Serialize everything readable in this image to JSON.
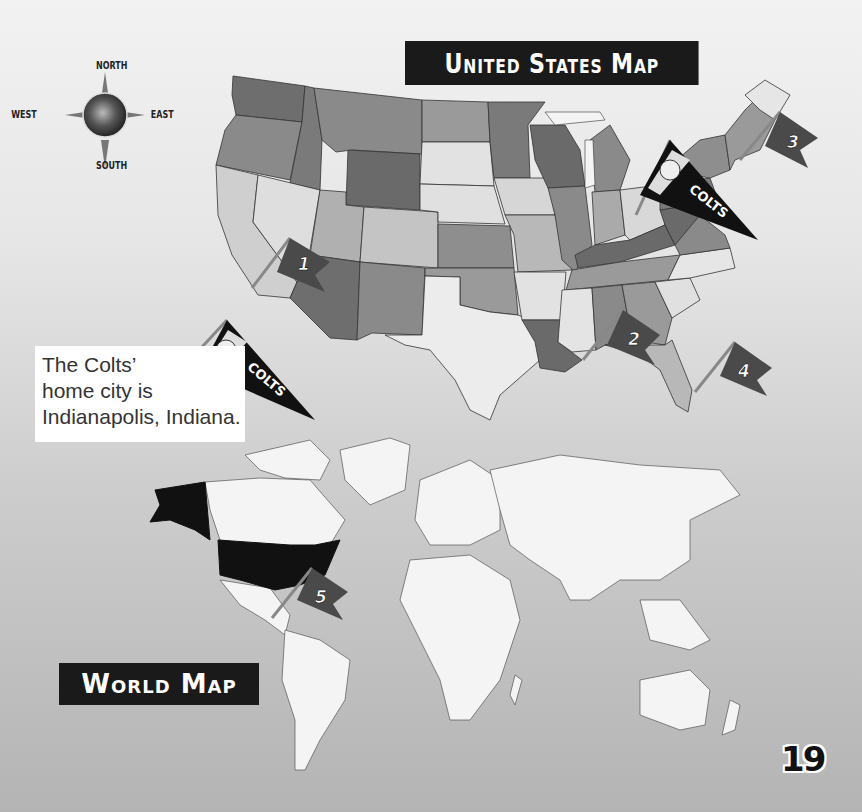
{
  "page": {
    "number": "19",
    "background_colors": [
      "#f2f2f2",
      "#b4b4b4"
    ]
  },
  "compass": {
    "north": "NORTH",
    "south": "SOUTH",
    "east": "EAST",
    "west": "WEST"
  },
  "us_map": {
    "title": "United States Map",
    "flags": [
      {
        "number": "1",
        "location": "southern California / Arizona"
      },
      {
        "number": "2",
        "location": "Alabama Gulf coast"
      },
      {
        "number": "3",
        "location": "New England"
      },
      {
        "number": "4",
        "location": "Florida"
      }
    ],
    "pennant": {
      "team": "COLTS",
      "location": "Indiana"
    }
  },
  "world_map": {
    "title": "World Map",
    "flags": [
      {
        "number": "5",
        "location": "Central America / Gulf of Mexico"
      }
    ],
    "highlighted_country": "United States",
    "highlight_color": "#111111"
  },
  "caption": {
    "lines": [
      "The Colts’",
      "home city is",
      "Indianapolis, Indiana."
    ]
  },
  "legend_pennant": {
    "team": "COLTS"
  },
  "colors": {
    "banner_bg": "#1a1a1a",
    "banner_text": "#ffffff",
    "flag": "#4a4a4a",
    "pennant": "#111111",
    "land_light": "#f4f4f4",
    "ocean": "#bdbdbd"
  }
}
